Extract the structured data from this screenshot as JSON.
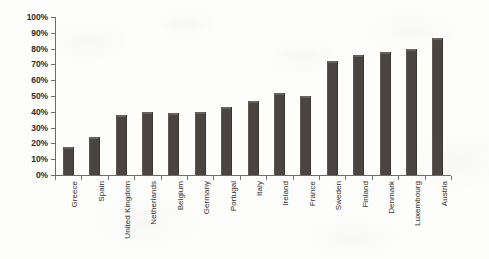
{
  "chart_data": {
    "type": "bar",
    "title": "",
    "subtitle": "",
    "xlabel": "",
    "ylabel": "",
    "ylim": [
      0,
      100
    ],
    "y_tick_labels": [
      "100%",
      "90%",
      "80%",
      "70%",
      "60%",
      "50%",
      "40%",
      "30%",
      "20%",
      "10%",
      "0%"
    ],
    "y_tick_values": [
      100,
      90,
      80,
      70,
      60,
      50,
      40,
      30,
      20,
      10,
      0
    ],
    "grid": false,
    "legend": false,
    "legend_position": "none",
    "bar_color": "#4a4540",
    "background_color": "#fdfdfc",
    "axis_color": "#6f6b66",
    "categories": [
      "Greece",
      "Spain",
      "United Kingdom",
      "Netherlands",
      "Belgium",
      "Germany",
      "Portugal",
      "Italy",
      "Ireland",
      "France",
      "Sweden",
      "Finland",
      "Denmark",
      "Luxembourg",
      "Austria"
    ],
    "values": [
      18,
      24,
      38,
      40,
      39,
      40,
      43,
      47,
      52,
      50,
      72,
      76,
      78,
      80,
      87
    ],
    "series": [
      {
        "name": "",
        "values": [
          18,
          24,
          38,
          40,
          39,
          40,
          43,
          47,
          52,
          50,
          72,
          76,
          78,
          80,
          87
        ]
      }
    ]
  }
}
